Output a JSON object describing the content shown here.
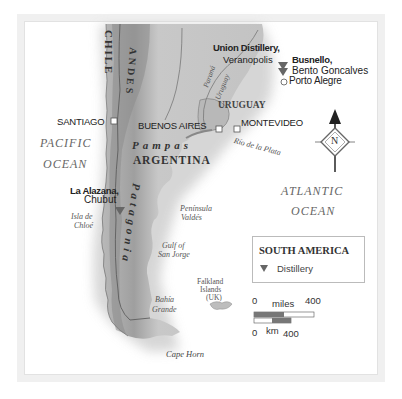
{
  "map": {
    "region": "South America (Southern Cone)",
    "oceans": [
      {
        "name_line1": "PACIFIC",
        "name_line2": "OCEAN"
      },
      {
        "name_line1": "ATLANTIC",
        "name_line2": "OCEAN"
      }
    ],
    "countries": [
      "CHILE",
      "ARGENTINA",
      "URUGUAY"
    ],
    "regions": [
      "ANDES",
      "Pampas",
      "Patagonia"
    ],
    "cities": [
      {
        "name": "SANTIAGO",
        "marker": "square"
      },
      {
        "name": "BUENOS AIRES",
        "marker": "square"
      },
      {
        "name": "MONTEVIDEO",
        "marker": "square"
      },
      {
        "name": "Porto Alegre",
        "marker": "circle"
      }
    ],
    "distilleries": [
      {
        "name": "Union Distillery,",
        "place": "Veranopolis"
      },
      {
        "name": "Busnello,",
        "place": "Bento Goncalves"
      },
      {
        "name": "La Alazana,",
        "place": "Chubut"
      }
    ],
    "rivers": [
      "Paraná",
      "Uruguay",
      "Río de la Plata"
    ],
    "features": [
      {
        "line1": "Isla de",
        "line2": "Chloé"
      },
      {
        "line1": "Península",
        "line2": "Valdés"
      },
      {
        "line1": "Gulf of",
        "line2": "San Jorge"
      },
      {
        "line1": "Bahía",
        "line2": "Grande"
      },
      {
        "line1": "Falkland",
        "line2": "Islands",
        "line3": "(UK)"
      },
      {
        "line1": "Cape Horn"
      }
    ],
    "compass": {
      "label": "N"
    }
  },
  "legend": {
    "title": "SOUTH AMERICA",
    "items": [
      {
        "symbol": "down-triangle",
        "label": "Distillery"
      }
    ],
    "color_symbol": "#666666"
  },
  "scale": {
    "miles_start": "0",
    "miles_label": "miles",
    "miles_end": "400",
    "km_start": "0",
    "km_label": "km",
    "km_end": "400"
  }
}
